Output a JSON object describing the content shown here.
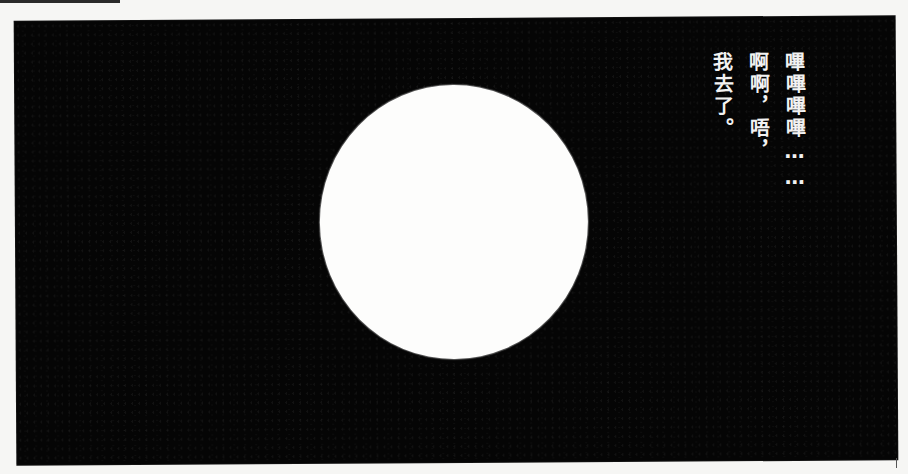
{
  "page": {
    "background_color": "#f6f6f4"
  },
  "panel": {
    "background_color": "#050505",
    "moon_color": "#fdfdfc",
    "caption": {
      "reading_direction": "vertical-right-to-left",
      "columns": [
        "嗶嗶嗶嗶……",
        "啊啊，唔，",
        "我去了。"
      ]
    }
  }
}
